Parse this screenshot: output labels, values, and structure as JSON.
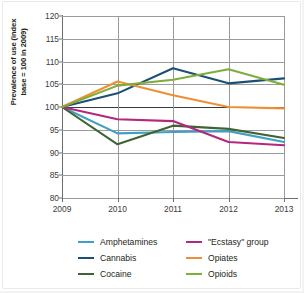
{
  "chart_data": {
    "type": "line",
    "title": "",
    "xlabel": "",
    "ylabel": "Prevalence of use (index base = 100 in 2009)",
    "ylabel_line1": "Prevalence of use (index",
    "ylabel_line2": "base = 100 in 2009)",
    "x": [
      "2009",
      "2010",
      "2011",
      "2012",
      "2013"
    ],
    "categories": [
      "2009",
      "2010",
      "2011",
      "2012",
      "2013"
    ],
    "xlim": [
      2009,
      2013
    ],
    "ylim": [
      80,
      120
    ],
    "yticks": [
      80,
      85,
      90,
      95,
      100,
      105,
      110,
      115,
      120
    ],
    "ytick_labels": [
      "80",
      "85",
      "90",
      "95",
      "100",
      "105",
      "110",
      "115",
      "120"
    ],
    "grid": true,
    "legend_position": "bottom",
    "series": [
      {
        "name": "Amphetamines",
        "color": "#3f9fc4",
        "values": [
          100,
          94.2,
          94.5,
          94.7,
          92.3
        ]
      },
      {
        "name": "Cannabis",
        "color": "#1d4f72",
        "values": [
          100,
          103.0,
          108.5,
          105.2,
          106.3
        ]
      },
      {
        "name": "Cocaine",
        "color": "#3d6432",
        "values": [
          100,
          91.8,
          95.9,
          95.2,
          93.2
        ]
      },
      {
        "name": "\"Ecstasy\" group",
        "color": "#b5267e",
        "values": [
          100,
          97.3,
          96.9,
          92.3,
          91.6
        ]
      },
      {
        "name": "Opiates",
        "color": "#ef8f32",
        "values": [
          100,
          105.6,
          102.6,
          100.0,
          99.7
        ]
      },
      {
        "name": "Opioids",
        "color": "#7dad3a",
        "values": [
          100,
          104.7,
          106.0,
          108.3,
          104.9
        ]
      }
    ]
  },
  "legend": {
    "columns": [
      {
        "items": [
          "Amphetamines",
          "Cannabis",
          "Cocaine"
        ]
      },
      {
        "items": [
          "\"Ecstasy\" group",
          "Opiates",
          "Opioids"
        ]
      }
    ]
  },
  "colors": {
    "amphetamines": "#3f9fc4",
    "cannabis": "#1d4f72",
    "cocaine": "#3d6432",
    "ecstasy": "#b5267e",
    "opiates": "#ef8f32",
    "opioids": "#7dad3a",
    "grid": "#9a9b9e",
    "axis": "#6d6e71",
    "text": "#231f20",
    "background": "#ffffff"
  }
}
